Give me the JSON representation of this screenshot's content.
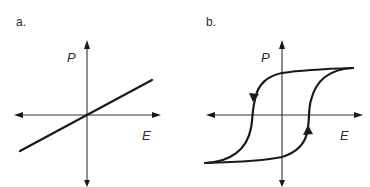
{
  "figure": {
    "panels": [
      {
        "label": "a.",
        "y_axis_label": "P",
        "x_axis_label": "E",
        "description": "Linear dielectric: polarization proportional to field"
      },
      {
        "label": "b.",
        "y_axis_label": "P",
        "x_axis_label": "E",
        "description": "Ferroelectric hysteresis loop with direction arrows"
      }
    ],
    "colors": {
      "line": "#1a1a1a",
      "axis": "#333333",
      "text": "#2a2a2a",
      "background": "#ffffff"
    }
  }
}
